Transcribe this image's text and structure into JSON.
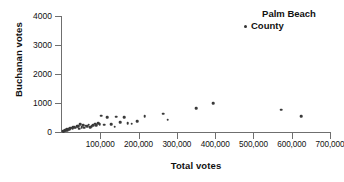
{
  "chart_data": {
    "type": "scatter",
    "title": "",
    "xlabel": "Total votes",
    "ylabel": "Buchanan votes",
    "xlim": [
      0,
      700000
    ],
    "ylim": [
      0,
      4000
    ],
    "xticks": [
      100000,
      200000,
      300000,
      400000,
      500000,
      600000,
      700000
    ],
    "xtick_labels": [
      "100,000",
      "200,000",
      "300,000",
      "400,000",
      "500,000",
      "600,000",
      "700,000"
    ],
    "yticks": [
      0,
      1000,
      2000,
      3000,
      4000
    ],
    "ytick_labels": [
      "0",
      "1000",
      "2000",
      "3000",
      "4000"
    ],
    "grid": false,
    "legend_position": "top-right",
    "legend": [
      "Palm Beach County"
    ],
    "marker_color": "#3a3a3a",
    "series": [
      {
        "name": "Florida counties",
        "points": [
          [
            2500,
            20
          ],
          [
            4800,
            35
          ],
          [
            6200,
            45
          ],
          [
            8000,
            60
          ],
          [
            9500,
            55
          ],
          [
            11000,
            75
          ],
          [
            12500,
            90
          ],
          [
            14000,
            70
          ],
          [
            16000,
            105
          ],
          [
            18500,
            120
          ],
          [
            20000,
            95
          ],
          [
            22000,
            130
          ],
          [
            25000,
            145
          ],
          [
            27500,
            110
          ],
          [
            30000,
            160
          ],
          [
            33000,
            175
          ],
          [
            36000,
            150
          ],
          [
            39000,
            190
          ],
          [
            42000,
            210
          ],
          [
            45000,
            120
          ],
          [
            48000,
            260
          ],
          [
            51000,
            170
          ],
          [
            55000,
            230
          ],
          [
            58000,
            145
          ],
          [
            62000,
            215
          ],
          [
            66000,
            190
          ],
          [
            70000,
            250
          ],
          [
            74000,
            175
          ],
          [
            78000,
            205
          ],
          [
            82000,
            240
          ],
          [
            86000,
            285
          ],
          [
            90000,
            225
          ],
          [
            94000,
            310
          ],
          [
            98000,
            270
          ],
          [
            103000,
            560
          ],
          [
            110000,
            250
          ],
          [
            118000,
            505
          ],
          [
            128000,
            275
          ],
          [
            138000,
            185
          ],
          [
            142000,
            530
          ],
          [
            152000,
            340
          ],
          [
            162000,
            520
          ],
          [
            172000,
            305
          ],
          [
            182000,
            285
          ],
          [
            196000,
            380
          ],
          [
            216000,
            545
          ],
          [
            264000,
            625
          ],
          [
            276000,
            430
          ],
          [
            350000,
            830
          ],
          [
            395000,
            995
          ],
          [
            573000,
            765
          ],
          [
            625000,
            545
          ]
        ]
      }
    ]
  },
  "legend": {
    "line1": "Palm Beach",
    "line2": "County",
    "marker": "dot-marker"
  },
  "axes": {
    "y_title": "Buchanan votes",
    "x_title": "Total votes"
  }
}
